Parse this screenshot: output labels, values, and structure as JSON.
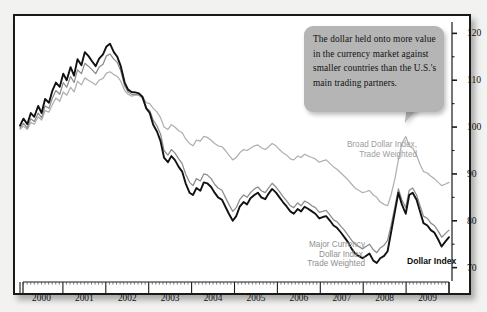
{
  "chart_data": {
    "type": "line",
    "title": "",
    "xlabel": "",
    "ylabel": "",
    "ylim": [
      68,
      122
    ],
    "yticks_major": [
      70,
      80,
      90,
      100,
      110,
      120
    ],
    "yticks_minor": [
      75,
      85,
      95,
      105,
      115
    ],
    "ytick_labels": [
      "70",
      "80",
      "90",
      "100",
      "110",
      "120"
    ],
    "grid": false,
    "legend_position": "inline-annotations",
    "x_axis_type": "year-bands",
    "categories": [
      "2000",
      "2001",
      "2002",
      "2003",
      "2004",
      "2005",
      "2006",
      "2007",
      "2008",
      "2009"
    ],
    "x_range": [
      2000.0,
      2009.92
    ],
    "series": [
      {
        "name": "Dollar Index",
        "color": "#111111",
        "style": "solid-bold",
        "x": [
          2000.0,
          2000.08,
          2000.17,
          2000.25,
          2000.33,
          2000.42,
          2000.5,
          2000.58,
          2000.67,
          2000.75,
          2000.83,
          2000.92,
          2001.0,
          2001.08,
          2001.17,
          2001.25,
          2001.33,
          2001.42,
          2001.5,
          2001.58,
          2001.67,
          2001.75,
          2001.83,
          2001.92,
          2002.0,
          2002.08,
          2002.17,
          2002.25,
          2002.33,
          2002.42,
          2002.5,
          2002.58,
          2002.67,
          2002.75,
          2002.83,
          2002.92,
          2003.0,
          2003.08,
          2003.17,
          2003.25,
          2003.33,
          2003.42,
          2003.5,
          2003.58,
          2003.67,
          2003.75,
          2003.83,
          2003.92,
          2004.0,
          2004.08,
          2004.17,
          2004.25,
          2004.33,
          2004.42,
          2004.5,
          2004.58,
          2004.67,
          2004.75,
          2004.83,
          2004.92,
          2005.0,
          2005.08,
          2005.17,
          2005.25,
          2005.33,
          2005.42,
          2005.5,
          2005.58,
          2005.67,
          2005.75,
          2005.83,
          2005.92,
          2006.0,
          2006.08,
          2006.17,
          2006.25,
          2006.33,
          2006.42,
          2006.5,
          2006.58,
          2006.67,
          2006.75,
          2006.83,
          2006.92,
          2007.0,
          2007.08,
          2007.17,
          2007.25,
          2007.33,
          2007.42,
          2007.5,
          2007.58,
          2007.67,
          2007.75,
          2007.83,
          2007.92,
          2008.0,
          2008.08,
          2008.17,
          2008.25,
          2008.33,
          2008.42,
          2008.5,
          2008.58,
          2008.67,
          2008.75,
          2008.83,
          2008.92,
          2009.0,
          2009.08,
          2009.17,
          2009.25,
          2009.33,
          2009.42,
          2009.5,
          2009.58,
          2009.67,
          2009.75,
          2009.83,
          2009.92
        ],
        "values": [
          100.3,
          101.8,
          100.6,
          103.0,
          102.2,
          104.5,
          103.0,
          106.0,
          105.2,
          107.8,
          109.5,
          108.6,
          111.4,
          110.0,
          112.8,
          111.0,
          114.5,
          113.2,
          116.0,
          115.2,
          114.0,
          113.0,
          114.6,
          115.5,
          117.2,
          117.8,
          116.0,
          115.0,
          113.0,
          109.5,
          108.0,
          107.5,
          107.4,
          107.2,
          106.5,
          104.0,
          103.0,
          100.5,
          99.0,
          97.0,
          93.5,
          92.5,
          93.8,
          93.0,
          91.5,
          90.5,
          88.0,
          86.0,
          85.5,
          87.0,
          86.4,
          88.2,
          88.0,
          87.2,
          86.0,
          85.0,
          84.5,
          83.0,
          81.5,
          80.0,
          81.0,
          83.0,
          84.0,
          83.5,
          84.8,
          85.5,
          86.0,
          85.0,
          84.6,
          85.8,
          86.8,
          86.0,
          85.0,
          84.0,
          83.0,
          82.0,
          81.5,
          82.5,
          82.0,
          83.0,
          82.5,
          82.0,
          81.5,
          80.5,
          80.8,
          81.0,
          80.0,
          79.0,
          78.5,
          77.5,
          76.5,
          75.5,
          74.0,
          73.0,
          72.5,
          72.0,
          72.5,
          73.0,
          71.5,
          71.0,
          72.0,
          72.5,
          73.5,
          77.5,
          82.0,
          86.0,
          83.5,
          81.5,
          85.5,
          86.0,
          84.5,
          82.0,
          79.5,
          79.0,
          78.0,
          77.5,
          76.0,
          74.5,
          75.5,
          76.5
        ]
      },
      {
        "name": "Major Currency Dollar Index, Trade Weighted",
        "color": "#8c8c8c",
        "style": "solid",
        "x": [
          2000.0,
          2000.08,
          2000.17,
          2000.25,
          2000.33,
          2000.42,
          2000.5,
          2000.58,
          2000.67,
          2000.75,
          2000.83,
          2000.92,
          2001.0,
          2001.08,
          2001.17,
          2001.25,
          2001.33,
          2001.42,
          2001.5,
          2001.58,
          2001.67,
          2001.75,
          2001.83,
          2001.92,
          2002.0,
          2002.08,
          2002.17,
          2002.25,
          2002.33,
          2002.42,
          2002.5,
          2002.58,
          2002.67,
          2002.75,
          2002.83,
          2002.92,
          2003.0,
          2003.08,
          2003.17,
          2003.25,
          2003.33,
          2003.42,
          2003.5,
          2003.58,
          2003.67,
          2003.75,
          2003.83,
          2003.92,
          2004.0,
          2004.08,
          2004.17,
          2004.25,
          2004.33,
          2004.42,
          2004.5,
          2004.58,
          2004.67,
          2004.75,
          2004.83,
          2004.92,
          2005.0,
          2005.08,
          2005.17,
          2005.25,
          2005.33,
          2005.42,
          2005.5,
          2005.58,
          2005.67,
          2005.75,
          2005.83,
          2005.92,
          2006.0,
          2006.08,
          2006.17,
          2006.25,
          2006.33,
          2006.42,
          2006.5,
          2006.58,
          2006.67,
          2006.75,
          2006.83,
          2006.92,
          2007.0,
          2007.08,
          2007.17,
          2007.25,
          2007.33,
          2007.42,
          2007.5,
          2007.58,
          2007.67,
          2007.75,
          2007.83,
          2007.92,
          2008.0,
          2008.08,
          2008.17,
          2008.25,
          2008.33,
          2008.42,
          2008.5,
          2008.58,
          2008.67,
          2008.75,
          2008.83,
          2008.92,
          2009.0,
          2009.08,
          2009.17,
          2009.25,
          2009.33,
          2009.42,
          2009.5,
          2009.58,
          2009.67,
          2009.75,
          2009.83,
          2009.92
        ],
        "values": [
          99.8,
          100.8,
          99.8,
          101.8,
          101.2,
          103.0,
          102.0,
          104.5,
          104.0,
          106.2,
          107.8,
          107.0,
          109.5,
          108.5,
          110.8,
          109.5,
          112.2,
          111.4,
          113.6,
          113.0,
          112.2,
          111.4,
          112.8,
          113.4,
          115.2,
          115.6,
          114.5,
          113.8,
          112.0,
          108.8,
          107.5,
          107.0,
          107.0,
          106.8,
          106.2,
          104.0,
          103.5,
          101.5,
          100.2,
          98.5,
          95.0,
          94.0,
          95.2,
          94.5,
          93.2,
          92.2,
          90.0,
          88.2,
          87.5,
          89.0,
          88.5,
          90.0,
          89.8,
          89.0,
          87.8,
          87.0,
          86.5,
          85.0,
          83.5,
          82.0,
          82.8,
          84.5,
          85.5,
          85.0,
          86.0,
          86.8,
          87.2,
          86.4,
          86.0,
          87.0,
          88.0,
          87.2,
          86.2,
          85.2,
          84.2,
          83.2,
          82.8,
          83.8,
          83.2,
          84.2,
          83.8,
          83.2,
          82.8,
          81.8,
          82.0,
          82.2,
          81.2,
          80.2,
          79.8,
          78.8,
          78.0,
          77.0,
          75.8,
          75.0,
          74.5,
          74.0,
          74.5,
          75.0,
          73.8,
          73.2,
          74.2,
          74.8,
          75.8,
          79.0,
          83.0,
          86.8,
          84.5,
          82.8,
          86.5,
          87.0,
          85.5,
          83.2,
          81.0,
          80.5,
          79.5,
          79.0,
          77.8,
          76.5,
          77.2,
          78.0
        ]
      },
      {
        "name": "Broad Dollar Index, Trade Weighted",
        "color": "#b0b0b0",
        "style": "solid",
        "x": [
          2000.0,
          2000.08,
          2000.17,
          2000.25,
          2000.33,
          2000.42,
          2000.5,
          2000.58,
          2000.67,
          2000.75,
          2000.83,
          2000.92,
          2001.0,
          2001.08,
          2001.17,
          2001.25,
          2001.33,
          2001.42,
          2001.5,
          2001.58,
          2001.67,
          2001.75,
          2001.83,
          2001.92,
          2002.0,
          2002.08,
          2002.17,
          2002.25,
          2002.33,
          2002.42,
          2002.5,
          2002.58,
          2002.67,
          2002.75,
          2002.83,
          2002.92,
          2003.0,
          2003.08,
          2003.17,
          2003.25,
          2003.33,
          2003.42,
          2003.5,
          2003.58,
          2003.67,
          2003.75,
          2003.83,
          2003.92,
          2004.0,
          2004.08,
          2004.17,
          2004.25,
          2004.33,
          2004.42,
          2004.5,
          2004.58,
          2004.67,
          2004.75,
          2004.83,
          2004.92,
          2005.0,
          2005.08,
          2005.17,
          2005.25,
          2005.33,
          2005.42,
          2005.5,
          2005.58,
          2005.67,
          2005.75,
          2005.83,
          2005.92,
          2006.0,
          2006.08,
          2006.17,
          2006.25,
          2006.33,
          2006.42,
          2006.5,
          2006.58,
          2006.67,
          2006.75,
          2006.83,
          2006.92,
          2007.0,
          2007.08,
          2007.17,
          2007.25,
          2007.33,
          2007.42,
          2007.5,
          2007.58,
          2007.67,
          2007.75,
          2007.83,
          2007.92,
          2008.0,
          2008.08,
          2008.17,
          2008.25,
          2008.33,
          2008.42,
          2008.5,
          2008.58,
          2008.67,
          2008.75,
          2008.83,
          2008.92,
          2009.0,
          2009.08,
          2009.17,
          2009.25,
          2009.33,
          2009.42,
          2009.5,
          2009.58,
          2009.67,
          2009.75,
          2009.83,
          2009.92
        ],
        "values": [
          99.5,
          100.2,
          99.5,
          101.0,
          100.6,
          102.2,
          101.5,
          103.5,
          103.2,
          104.8,
          106.2,
          105.5,
          107.5,
          106.8,
          108.5,
          107.5,
          109.8,
          109.0,
          110.5,
          110.0,
          109.5,
          109.0,
          110.0,
          110.4,
          111.5,
          111.8,
          111.2,
          110.8,
          109.8,
          107.8,
          107.0,
          106.6,
          106.8,
          107.0,
          106.5,
          105.2,
          105.0,
          104.0,
          103.2,
          102.0,
          100.0,
          99.5,
          100.5,
          100.0,
          99.2,
          98.8,
          97.5,
          96.5,
          96.0,
          97.2,
          97.0,
          98.0,
          97.8,
          97.2,
          96.5,
          96.0,
          95.8,
          95.0,
          94.0,
          93.0,
          93.5,
          94.5,
          95.2,
          95.0,
          95.5,
          96.0,
          96.2,
          95.6,
          95.2,
          95.8,
          96.5,
          96.0,
          95.2,
          94.5,
          94.0,
          93.2,
          93.0,
          93.8,
          93.5,
          94.2,
          93.8,
          93.5,
          93.2,
          92.5,
          92.8,
          93.0,
          92.2,
          91.5,
          91.0,
          90.2,
          89.5,
          88.8,
          87.8,
          87.0,
          86.5,
          86.0,
          86.2,
          86.5,
          85.5,
          85.0,
          84.0,
          83.5,
          83.2,
          85.5,
          89.0,
          93.0,
          96.5,
          98.0,
          96.0,
          95.5,
          94.0,
          92.0,
          90.5,
          90.2,
          89.5,
          89.0,
          88.2,
          87.5,
          87.8,
          88.2
        ]
      }
    ],
    "annotations": [
      {
        "id": "callout",
        "text": "The dollar held onto more value in the currency market against smaller countries than the U.S.'s main trading partners.",
        "points_to": "Broad Dollar Index, Trade Weighted"
      },
      {
        "id": "label-broad",
        "text": "Broad Dollar Index,\nTrade Weighted"
      },
      {
        "id": "label-major",
        "text": "Major Currency\nDollar Index,\nTrade Weighted"
      },
      {
        "id": "label-dollar",
        "text": "Dollar Index"
      }
    ]
  },
  "axis": {
    "y_labels": [
      "120",
      "110",
      "100",
      "90",
      "80",
      "70"
    ],
    "x_labels": [
      "2000",
      "2001",
      "2002",
      "2003",
      "2004",
      "2005",
      "2006",
      "2007",
      "2008",
      "2009"
    ]
  },
  "colors": {
    "dollar_index": "#111111",
    "major_currency": "#8c8c8c",
    "broad_dollar": "#b0b0b0",
    "callout_bg": "#b5b5b5",
    "frame": "#1a1a1a",
    "page_bg": "#f2f2f0"
  }
}
